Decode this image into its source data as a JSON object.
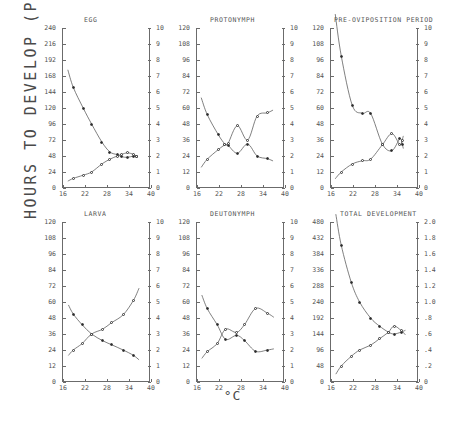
{
  "figure": {
    "ylabel": "HOURS TO DEVELOP (P)",
    "xlabel": "°C",
    "xticks": [
      "16",
      "22",
      "28",
      "34",
      "40"
    ],
    "xlim": [
      16,
      40
    ],
    "line_color": "#555555",
    "marker_color": "#2b2b2b"
  },
  "chart_data": [
    {
      "type": "scatter",
      "title": "EGG",
      "xlabel": "°C",
      "ylabel": "HOURS TO DEVELOP (P)",
      "xlim": [
        16,
        40
      ],
      "ylim_left": [
        0,
        240
      ],
      "ylim_right": [
        0,
        10
      ],
      "yticks_left": [
        "0",
        "24",
        "48",
        "72",
        "96",
        "120",
        "144",
        "168",
        "192",
        "216",
        "240"
      ],
      "yticks_right": [
        "0",
        "1",
        "2",
        "3",
        "4",
        "5",
        "6",
        "7",
        "8",
        "9",
        "10"
      ],
      "grid": false,
      "legend": "none",
      "series": [
        {
          "name": "hours to develop",
          "axis": "left",
          "marker": "filled-circle",
          "x": [
            18.8,
            21.5,
            23.8,
            26.6,
            28.8,
            30.8,
            32.0,
            33.6,
            35.2,
            36.0
          ],
          "values": [
            151,
            120,
            96,
            69,
            54,
            50,
            47,
            46,
            48,
            48
          ]
        },
        {
          "name": "developmental rate",
          "axis": "right",
          "marker": "open-circle",
          "x": [
            18.8,
            21.5,
            23.8,
            26.6,
            28.8,
            30.8,
            32.0,
            33.6,
            35.2,
            36.0
          ],
          "values": [
            0.6,
            0.8,
            1.0,
            1.5,
            1.8,
            2.0,
            2.1,
            2.2,
            2.1,
            2.0
          ]
        }
      ]
    },
    {
      "type": "scatter",
      "title": "PROTONYMPH",
      "xlabel": "°C",
      "ylabel": "HOURS TO DEVELOP (P)",
      "xlim": [
        16,
        40
      ],
      "ylim_left": [
        0,
        120
      ],
      "ylim_right": [
        0,
        10
      ],
      "yticks_left": [
        "0",
        "12",
        "24",
        "36",
        "48",
        "60",
        "72",
        "84",
        "96",
        "108",
        "120"
      ],
      "yticks_right": [
        "0",
        "1",
        "2",
        "3",
        "4",
        "5",
        "6",
        "7",
        "8",
        "9",
        "10"
      ],
      "grid": false,
      "legend": "none",
      "series": [
        {
          "name": "hours to develop",
          "axis": "left",
          "marker": "filled-circle",
          "x": [
            18.8,
            21.8,
            23.6,
            24.5,
            27.0,
            29.8,
            32.4,
            35.2
          ],
          "values": [
            55,
            40,
            33,
            32,
            26,
            33,
            24,
            22
          ]
        },
        {
          "name": "developmental rate",
          "axis": "right",
          "marker": "open-circle",
          "x": [
            18.8,
            21.8,
            23.6,
            24.5,
            27.0,
            29.8,
            32.4,
            35.2
          ],
          "values": [
            1.8,
            2.4,
            2.7,
            2.8,
            3.9,
            3.0,
            4.5,
            4.7
          ]
        }
      ]
    },
    {
      "type": "scatter",
      "title": "PRE-OVIPOSITION PERIOD",
      "xlabel": "°C",
      "ylabel": "HOURS TO DEVELOP (P)",
      "xlim": [
        16,
        40
      ],
      "ylim_left": [
        0,
        120
      ],
      "ylim_right": [
        0,
        10
      ],
      "yticks_left": [
        "0",
        "12",
        "24",
        "36",
        "48",
        "60",
        "72",
        "84",
        "96",
        "108",
        "120"
      ],
      "yticks_right": [
        "0",
        "1",
        "2",
        "3",
        "4",
        "5",
        "6",
        "7",
        "8",
        "9",
        "10"
      ],
      "grid": false,
      "legend": "none",
      "series": [
        {
          "name": "hours to develop",
          "axis": "left",
          "marker": "filled-circle",
          "x": [
            18.8,
            21.8,
            24.5,
            26.8,
            30.0,
            32.6,
            34.8,
            35.4
          ],
          "values": [
            99,
            62,
            56,
            56,
            33,
            28,
            37,
            33
          ]
        },
        {
          "name": "developmental rate",
          "axis": "right",
          "marker": "open-circle",
          "x": [
            18.8,
            21.8,
            24.5,
            26.8,
            30.0,
            32.6,
            34.8,
            35.4
          ],
          "values": [
            1.0,
            1.5,
            1.7,
            1.8,
            2.7,
            3.4,
            2.7,
            3.0
          ]
        }
      ]
    },
    {
      "type": "scatter",
      "title": "LARVA",
      "xlabel": "°C",
      "ylabel": "HOURS TO DEVELOP (P)",
      "xlim": [
        16,
        40
      ],
      "ylim_left": [
        0,
        120
      ],
      "ylim_right": [
        0,
        10
      ],
      "yticks_left": [
        "0",
        "12",
        "24",
        "36",
        "48",
        "60",
        "72",
        "84",
        "96",
        "108",
        "120"
      ],
      "yticks_right": [
        "0",
        "1",
        "2",
        "3",
        "4",
        "5",
        "6",
        "7",
        "8",
        "9",
        "10"
      ],
      "grid": false,
      "legend": "none",
      "series": [
        {
          "name": "hours to develop",
          "axis": "left",
          "marker": "filled-circle",
          "x": [
            18.8,
            21.2,
            23.8,
            26.8,
            29.2,
            32.4,
            35.2
          ],
          "values": [
            51,
            43,
            36,
            31,
            28,
            24,
            20
          ]
        },
        {
          "name": "developmental rate",
          "axis": "right",
          "marker": "open-circle",
          "x": [
            18.8,
            21.2,
            23.8,
            26.8,
            29.2,
            32.4,
            35.2
          ],
          "values": [
            2.0,
            2.4,
            3.0,
            3.3,
            3.7,
            4.2,
            5.1
          ]
        }
      ]
    },
    {
      "type": "scatter",
      "title": "DEUTONYMPH",
      "xlabel": "°C",
      "ylabel": "HOURS TO DEVELOP (P)",
      "xlim": [
        16,
        40
      ],
      "ylim_left": [
        0,
        120
      ],
      "ylim_right": [
        0,
        10
      ],
      "yticks_left": [
        "0",
        "12",
        "24",
        "36",
        "48",
        "60",
        "72",
        "84",
        "96",
        "108",
        "120"
      ],
      "yticks_right": [
        "0",
        "1",
        "2",
        "3",
        "4",
        "5",
        "6",
        "7",
        "8",
        "9",
        "10"
      ],
      "grid": false,
      "legend": "none",
      "series": [
        {
          "name": "hours to develop",
          "axis": "left",
          "marker": "filled-circle",
          "x": [
            18.8,
            21.5,
            23.8,
            26.8,
            29.0,
            32.0,
            35.2
          ],
          "values": [
            55,
            43,
            32,
            35,
            31,
            23,
            24
          ]
        },
        {
          "name": "developmental rate",
          "axis": "right",
          "marker": "open-circle",
          "x": [
            18.8,
            21.5,
            23.8,
            26.8,
            29.0,
            32.0,
            35.2
          ],
          "values": [
            1.9,
            2.4,
            3.3,
            3.1,
            3.6,
            4.6,
            4.3
          ]
        }
      ]
    },
    {
      "type": "scatter",
      "title": "TOTAL DEVELOPMENT",
      "xlabel": "°C",
      "ylabel": "HOURS TO DEVELOP (P)",
      "xlim": [
        16,
        40
      ],
      "ylim_left": [
        0,
        480
      ],
      "ylim_right": [
        0,
        2.0
      ],
      "yticks_left": [
        "0",
        "48",
        "96",
        "144",
        "192",
        "240",
        "288",
        "336",
        "384",
        "432",
        "480"
      ],
      "yticks_right": [
        "0",
        ".2",
        ".4",
        ".6",
        ".8",
        "1.0",
        "1.2",
        "1.4",
        "1.6",
        "1.8",
        "2.0"
      ],
      "grid": false,
      "legend": "none",
      "series": [
        {
          "name": "hours to develop",
          "axis": "left",
          "marker": "filled-circle",
          "x": [
            18.8,
            21.5,
            23.8,
            26.8,
            29.2,
            31.6,
            33.2,
            35.2
          ],
          "values": [
            410,
            300,
            240,
            192,
            168,
            150,
            144,
            150
          ]
        },
        {
          "name": "developmental rate",
          "axis": "right",
          "marker": "open-circle",
          "x": [
            18.8,
            21.5,
            23.8,
            26.8,
            29.2,
            31.6,
            33.2,
            35.2
          ],
          "values": [
            0.2,
            0.32,
            0.4,
            0.46,
            0.54,
            0.62,
            0.7,
            0.64
          ]
        }
      ]
    }
  ],
  "panels": {
    "egg": {
      "title": "EGG"
    },
    "protonymph": {
      "title": "PROTONYMPH"
    },
    "preoviposition": {
      "title": "PRE-OVIPOSITION PERIOD"
    },
    "larva": {
      "title": "LARVA"
    },
    "deutonymph": {
      "title": "DEUTONYMPH"
    },
    "total": {
      "title": "TOTAL DEVELOPMENT"
    }
  }
}
